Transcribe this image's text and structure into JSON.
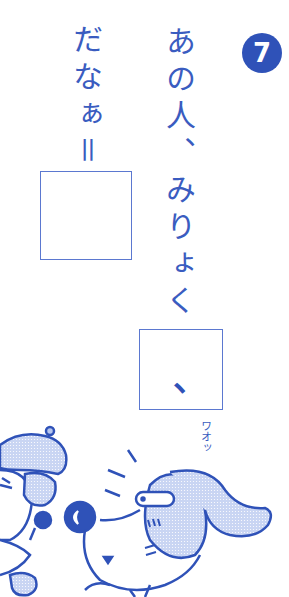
{
  "problem": {
    "number": "7",
    "right_column_text": "あの人、みりょく",
    "left_column_text": "だなぁ＝",
    "answer_boxes": [
      {
        "id": "box1",
        "content": ""
      },
      {
        "id": "box2",
        "content": "、"
      }
    ]
  },
  "illustration": {
    "sound_effect": "ワオッ",
    "description": "poodle character with beret and dog character with tiny hat surprised"
  },
  "colors": {
    "primary_blue": "#2f52b8",
    "text_blue": "#3a5cc0",
    "light_blue_fill": "#b6c6ee",
    "background": "#ffffff"
  }
}
